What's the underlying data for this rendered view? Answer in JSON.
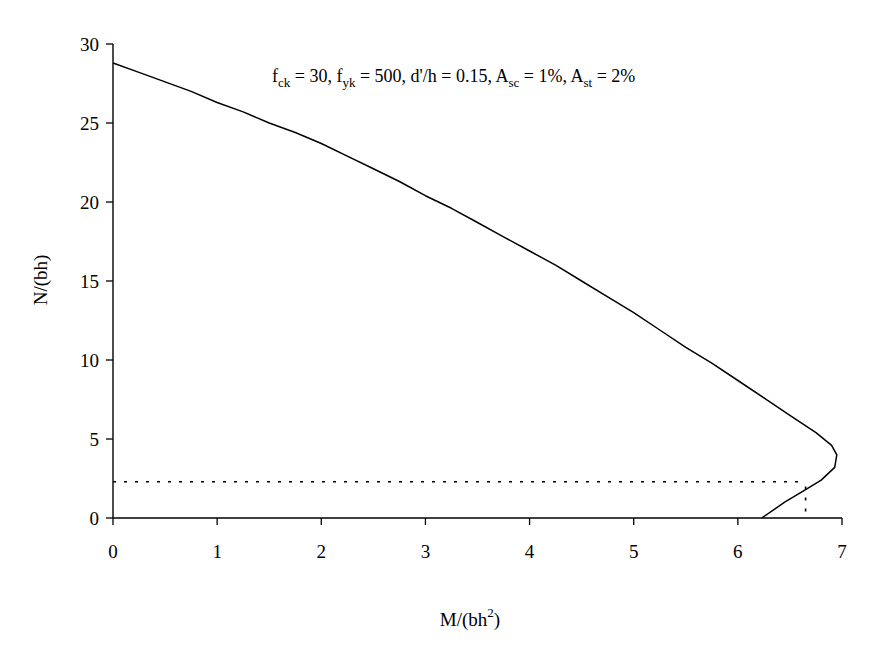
{
  "chart_data": {
    "type": "line",
    "title": "",
    "annotation": {
      "parts": [
        {
          "t": "f",
          "sub": "ck",
          "after": " = 30, "
        },
        {
          "t": "f",
          "sub": "yk",
          "after": " = 500, d'/h = 0.15, "
        },
        {
          "t": "A",
          "sub": "sc",
          "after": " = 1%, "
        },
        {
          "t": "A",
          "sub": "st",
          "after": " =  2%"
        }
      ],
      "plain_text": "f_ck = 30, f_yk = 500, d'/h = 0.15, A_sc = 1%, A_st = 2%"
    },
    "xlabel": "M/(bh",
    "xlabel_sup": "2",
    "xlabel_close": ")",
    "ylabel": "N/(bh)",
    "xlim": [
      0,
      7
    ],
    "ylim": [
      0,
      30
    ],
    "xticks": [
      0,
      1,
      2,
      3,
      4,
      5,
      6,
      7
    ],
    "yticks": [
      0,
      5,
      10,
      15,
      20,
      25,
      30
    ],
    "grid": false,
    "legend": null,
    "series": [
      {
        "name": "Interaction curve",
        "style": "solid",
        "points": [
          [
            0.0,
            28.8
          ],
          [
            0.25,
            28.2
          ],
          [
            0.5,
            27.6
          ],
          [
            0.75,
            27.0
          ],
          [
            1.0,
            26.3
          ],
          [
            1.25,
            25.7
          ],
          [
            1.5,
            25.0
          ],
          [
            1.75,
            24.4
          ],
          [
            2.0,
            23.7
          ],
          [
            2.25,
            22.9
          ],
          [
            2.5,
            22.1
          ],
          [
            2.75,
            21.3
          ],
          [
            3.0,
            20.4
          ],
          [
            3.25,
            19.6
          ],
          [
            3.5,
            18.7
          ],
          [
            3.75,
            17.8
          ],
          [
            4.0,
            16.9
          ],
          [
            4.25,
            16.0
          ],
          [
            4.5,
            15.0
          ],
          [
            4.75,
            14.0
          ],
          [
            5.0,
            13.0
          ],
          [
            5.25,
            11.9
          ],
          [
            5.5,
            10.8
          ],
          [
            5.75,
            9.8
          ],
          [
            6.0,
            8.7
          ],
          [
            6.25,
            7.6
          ],
          [
            6.5,
            6.5
          ],
          [
            6.75,
            5.4
          ],
          [
            6.9,
            4.6
          ],
          [
            6.95,
            4.0
          ],
          [
            6.93,
            3.2
          ],
          [
            6.8,
            2.4
          ],
          [
            6.65,
            1.8
          ],
          [
            6.45,
            1.0
          ],
          [
            6.23,
            0.0
          ]
        ]
      },
      {
        "name": "Reference horizontal",
        "style": "dotted",
        "points": [
          [
            0.0,
            2.3
          ],
          [
            6.65,
            2.3
          ]
        ]
      },
      {
        "name": "Reference vertical",
        "style": "dotted",
        "points": [
          [
            6.65,
            2.0
          ],
          [
            6.65,
            0.0
          ]
        ]
      }
    ]
  }
}
